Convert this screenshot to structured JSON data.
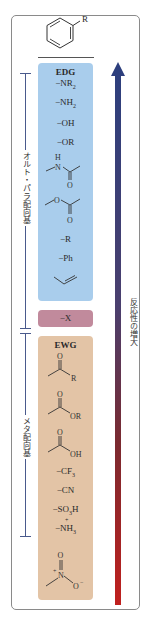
{
  "header": {
    "substituent_label": "R"
  },
  "edg_box": {
    "title": "EDG",
    "color": "#a9cdec",
    "groups": [
      {
        "main": "−NR",
        "sub": "2"
      },
      {
        "main": "−NH",
        "sub": "2"
      },
      {
        "main": "−OH"
      },
      {
        "main": "−OR"
      },
      {
        "structure": "acetamido",
        "atom_h": "H",
        "atom_n": "N",
        "atom_o": "O"
      },
      {
        "structure": "acetoxy",
        "atom_o1": "O",
        "atom_o2": "O"
      },
      {
        "main": "−R"
      },
      {
        "main": "−Ph"
      },
      {
        "structure": "vinyl"
      }
    ]
  },
  "halogen_box": {
    "label": "−X",
    "color": "#c18a9c"
  },
  "ewg_box": {
    "title": "EWG",
    "color": "#e3c4a6",
    "groups": [
      {
        "structure": "ketone",
        "atom_o": "O",
        "atom_r": "R"
      },
      {
        "structure": "ester",
        "atom_o": "O",
        "atom_or": "OR"
      },
      {
        "structure": "carboxylic-acid",
        "atom_o": "O",
        "atom_oh": "OH"
      },
      {
        "main": "−CF",
        "sub": "3"
      },
      {
        "main": "−CN"
      },
      {
        "main": "−SO",
        "sub": "3",
        "tail": "H"
      },
      {
        "main": "−NH",
        "sub": "3",
        "charge": "+"
      },
      {
        "structure": "nitro",
        "atom_o_top": "O",
        "atom_n": "N",
        "charge_n": "+",
        "atom_o_right": "O",
        "charge_o": "−"
      }
    ]
  },
  "labels": {
    "ortho_para": "オルト・パラ配向基",
    "meta": "メタ配向基",
    "reactivity": "反応性の増大"
  },
  "arrow": {
    "top_color": "#2c3f7e",
    "bottom_color": "#c0201e"
  }
}
